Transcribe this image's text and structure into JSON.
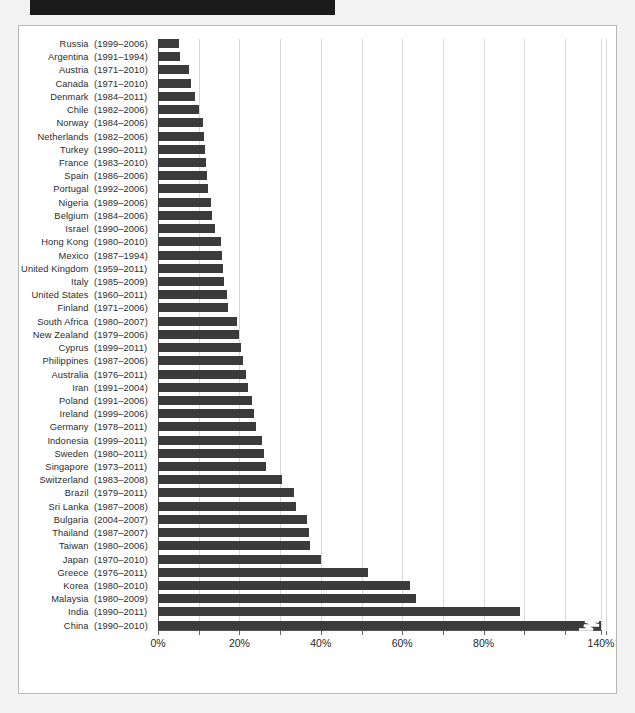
{
  "page": {
    "background_color": "#f3f3f3",
    "title_redacted": true,
    "redaction_color": "#1b1b1b"
  },
  "chart_frame": {
    "background_color": "#ffffff",
    "border_color": "#b8b8b8"
  },
  "chart_data": {
    "type": "bar",
    "orientation": "horizontal",
    "title": "",
    "subtitle": "",
    "xlabel": "",
    "ylabel": "",
    "xlim": [
      0,
      140
    ],
    "axis_break": {
      "present": true,
      "after_value": 100,
      "resumes_at_value": 140,
      "marker": "zigzag",
      "marker_color": "#ffffff",
      "applies_to_category": "China"
    },
    "grid": true,
    "grid_orientation": "vertical",
    "grid_step": 10,
    "legend": "none",
    "bar_color": "#3b3b3b",
    "gridline_color": "#d6d6d6",
    "tick_labels": [
      "0%",
      "20%",
      "40%",
      "60%",
      "80%",
      "140%"
    ],
    "tick_values": [
      0,
      20,
      40,
      60,
      80,
      140
    ],
    "minor_tick_values": [
      10,
      30,
      50,
      70,
      90,
      100,
      110,
      120,
      130
    ],
    "value_unit": "%",
    "categories": [
      "Russia",
      "Argentina",
      "Austria",
      "Canada",
      "Denmark",
      "Chile",
      "Norway",
      "Netherlands",
      "Turkey",
      "France",
      "Spain",
      "Portugal",
      "Nigeria",
      "Belgium",
      "Israel",
      "Hong Kong",
      "Mexico",
      "United Kingdom",
      "Italy",
      "United States",
      "Finland",
      "South Africa",
      "New Zealand",
      "Cyprus",
      "Philippines",
      "Australia",
      "Iran",
      "Poland",
      "Ireland",
      "Germany",
      "Indonesia",
      "Sweden",
      "Singapore",
      "Switzerland",
      "Brazil",
      "Sri Lanka",
      "Bulgaria",
      "Thailand",
      "Taiwan",
      "Japan",
      "Greece",
      "Korea",
      "Malaysia",
      "India",
      "China"
    ],
    "category_periods": [
      "(1999–2006)",
      "(1991–1994)",
      "(1971–2010)",
      "(1971–2010)",
      "(1984–2011)",
      "(1982–2006)",
      "(1984–2006)",
      "(1982–2006)",
      "(1990–2011)",
      "(1983–2010)",
      "(1986–2006)",
      "(1992–2006)",
      "(1989–2006)",
      "(1984–2006)",
      "(1990–2006)",
      "(1980–2010)",
      "(1987–1994)",
      "(1959–2011)",
      "(1985–2009)",
      "(1960–2011)",
      "(1971–2006)",
      "(1980–2007)",
      "(1979–2006)",
      "(1999–2011)",
      "(1987–2006)",
      "(1976–2011)",
      "(1991–2004)",
      "(1991–2006)",
      "(1999–2006)",
      "(1978–2011)",
      "(1999–2011)",
      "(1980–2011)",
      "(1973–2011)",
      "(1983–2008)",
      "(1979–2011)",
      "(1987–2008)",
      "(2004–2007)",
      "(1987–2007)",
      "(1980–2006)",
      "(1970–2010)",
      "(1976–2011)",
      "(1980–2010)",
      "(1980–2009)",
      "(1990–2011)",
      "(1990–2010)"
    ],
    "values": [
      5.2,
      5.5,
      7.5,
      8.0,
      9.2,
      10.0,
      11.0,
      11.3,
      11.5,
      11.8,
      12.0,
      12.3,
      13.0,
      13.3,
      14.0,
      15.5,
      15.7,
      16.0,
      16.2,
      17.0,
      17.3,
      19.5,
      20.0,
      20.5,
      21.0,
      21.5,
      22.0,
      23.0,
      23.5,
      24.0,
      25.5,
      26.0,
      26.5,
      30.5,
      33.5,
      34.0,
      36.5,
      37.0,
      37.3,
      40.0,
      51.5,
      62.0,
      63.5,
      89.0,
      140.0
    ]
  }
}
